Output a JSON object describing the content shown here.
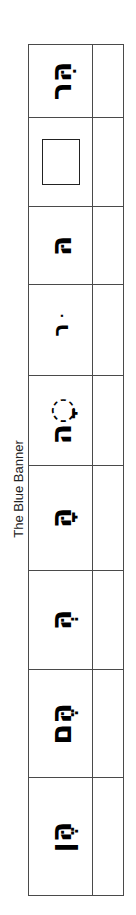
{
  "side_title": "The Blue Banner",
  "colors": {
    "grid_line": "#4a4a4a",
    "text": "#000000"
  },
  "rows": [
    {
      "type": "text",
      "hebrew": "הִּר",
      "answer": ""
    },
    {
      "type": "box",
      "hebrew": "",
      "answer": ""
    },
    {
      "type": "text",
      "hebrew": "הּ",
      "answer": ""
    },
    {
      "type": "text",
      "hebrew": "ּר",
      "answer": ""
    },
    {
      "type": "text",
      "hebrew": "◌ָה",
      "answer": ""
    },
    {
      "type": "text",
      "hebrew": "הָּ",
      "answer": ""
    },
    {
      "type": "text",
      "hebrew": "הְּ",
      "answer": ""
    },
    {
      "type": "text",
      "hebrew": "הֶּם",
      "answer": ""
    },
    {
      "type": "text",
      "hebrew": "הֶּן",
      "answer": ""
    }
  ]
}
